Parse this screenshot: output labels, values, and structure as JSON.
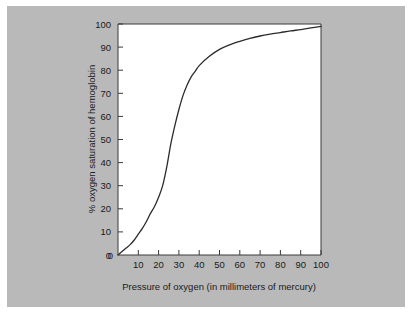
{
  "figure": {
    "background_color": "#b9b9b9",
    "plot_background_color": "#ffffff",
    "curve_color": "#2b2b2b",
    "axis_color": "#3a3a3a"
  },
  "chart_data": {
    "type": "line",
    "title": "",
    "xlabel": "Pressure of oxygen (in millimeters of mercury)",
    "ylabel": "% oxygen saturation of hemoglobin",
    "xlim": [
      0,
      100
    ],
    "ylim": [
      0,
      100
    ],
    "xticks": [
      0,
      10,
      20,
      30,
      40,
      50,
      60,
      70,
      80,
      90,
      100
    ],
    "yticks": [
      0,
      10,
      20,
      30,
      40,
      50,
      60,
      70,
      80,
      90,
      100
    ],
    "xtick_labels": [
      "0",
      "10",
      "20",
      "30",
      "40",
      "50",
      "60",
      "70",
      "80",
      "90",
      "100"
    ],
    "ytick_labels": [
      "0",
      "10",
      "20",
      "30",
      "40",
      "50",
      "60",
      "70",
      "80",
      "90",
      "100"
    ],
    "grid": false,
    "legend": false,
    "series": [
      {
        "name": "Oxygen-hemoglobin dissociation curve",
        "x": [
          0,
          2,
          4,
          6,
          8,
          10,
          12,
          14,
          16,
          18,
          20,
          22,
          24,
          26,
          28,
          30,
          32,
          34,
          36,
          38,
          40,
          45,
          50,
          55,
          60,
          65,
          70,
          75,
          80,
          85,
          90,
          95,
          100
        ],
        "y": [
          0,
          1.5,
          3,
          4.5,
          6.5,
          9,
          11.5,
          14.5,
          18,
          21,
          25,
          30,
          38,
          48,
          56,
          63,
          69,
          73.5,
          77,
          79.5,
          82,
          86,
          89,
          91,
          92.5,
          93.8,
          94.8,
          95.6,
          96.3,
          97,
          97.6,
          98.3,
          99
        ]
      }
    ]
  }
}
